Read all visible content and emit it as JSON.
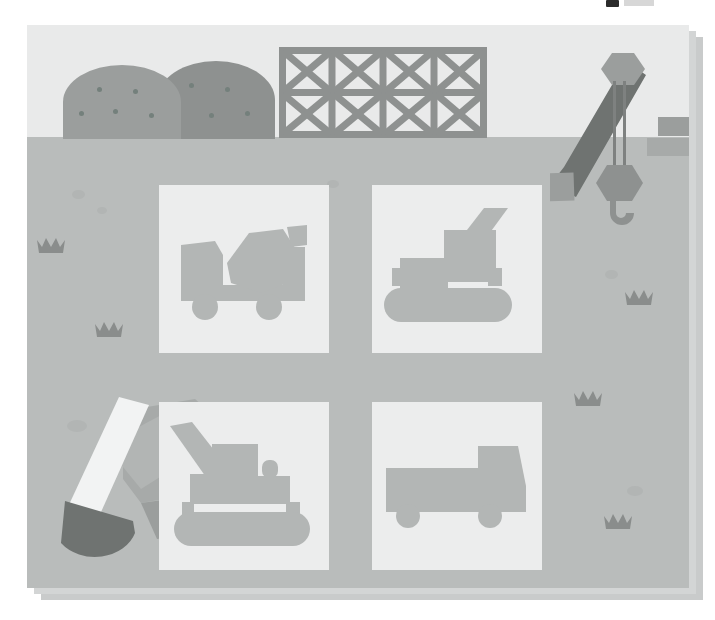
{
  "scene": {
    "title": "Construction Site Illustration",
    "palette": {
      "sky": "#e9eaea",
      "ground": "#b9bcbb",
      "paper_shadow_near": "#d3d5d5",
      "paper_shadow_far": "#c9cbcb",
      "card_background": "#eceded",
      "vehicle_gray": "#b3b6b5",
      "mid_gray": "#9b9e9d",
      "dark_gray": "#8e9190",
      "darkest_gray": "#6f7371",
      "highlight_white": "#f2f3f3",
      "speckle": "#b2b5b4",
      "crown": "#8a8d8c"
    },
    "canvas": {
      "x": 27,
      "y": 25,
      "width": 662,
      "height": 563
    },
    "horizon_y": 112
  },
  "top_strip": {
    "glyph_label": "cropped-text-fragment",
    "chip_label": "cropped-ui-chip"
  },
  "background": {
    "piles": [
      {
        "name": "gravel-pile-back",
        "x": 130,
        "y": 36,
        "w": 118,
        "h": 78,
        "color": "#8e9190",
        "dots": [
          [
            32,
            22
          ],
          [
            68,
            26
          ],
          [
            18,
            47
          ],
          [
            52,
            52
          ],
          [
            88,
            50
          ]
        ]
      },
      {
        "name": "gravel-pile-front",
        "x": 36,
        "y": 40,
        "w": 118,
        "h": 74,
        "color": "#9b9e9d",
        "dots": [
          [
            34,
            22
          ],
          [
            70,
            24
          ],
          [
            16,
            46
          ],
          [
            50,
            44
          ],
          [
            86,
            48
          ]
        ]
      }
    ],
    "scaffold": {
      "name": "scaffold-truss",
      "columns": 4,
      "rows": 2,
      "color": "#8e9190",
      "x": 252,
      "y": 22,
      "w": 208,
      "h": 91
    },
    "crane": {
      "name": "tower-crane",
      "boom_color": "#6f7371",
      "pulley_color": "#9b9e9d",
      "hook_color": "#8e9190",
      "cable_color": "#7e8180"
    },
    "bricks": [
      {
        "name": "brick-top",
        "x": 631,
        "y": 92,
        "w": 64,
        "h": 19,
        "color": "#9b9e9d"
      },
      {
        "name": "brick-bottom",
        "x": 620,
        "y": 113,
        "w": 75,
        "h": 18,
        "color": "#a7aaa9"
      }
    ],
    "excavator_left": {
      "name": "excavator-with-bucket",
      "arm_color": "#f2f3f3",
      "bucket_color": "#6f7371",
      "body_color": "#a7aaa9"
    },
    "speckles": [
      {
        "x": 45,
        "y": 165,
        "w": 13,
        "h": 9
      },
      {
        "x": 70,
        "y": 182,
        "w": 10,
        "h": 7
      },
      {
        "x": 300,
        "y": 155,
        "w": 12,
        "h": 8
      },
      {
        "x": 40,
        "y": 395,
        "w": 20,
        "h": 12
      },
      {
        "x": 605,
        "y": 245,
        "w": 13,
        "h": 9
      },
      {
        "x": 627,
        "y": 461,
        "w": 16,
        "h": 10
      }
    ],
    "crowns": [
      {
        "x": 37,
        "y": 236,
        "w": 28,
        "h": 18
      },
      {
        "x": 95,
        "y": 320,
        "w": 28,
        "h": 18
      },
      {
        "x": 625,
        "y": 288,
        "w": 28,
        "h": 18
      },
      {
        "x": 574,
        "y": 389,
        "w": 28,
        "h": 18
      },
      {
        "x": 604,
        "y": 512,
        "w": 28,
        "h": 18
      }
    ]
  },
  "cards": [
    {
      "id": "card-cement-mixer",
      "icon": "cement-mixer-truck-icon",
      "label": "Cement Mixer Truck"
    },
    {
      "id": "card-crawler-crane",
      "icon": "crawler-crane-icon",
      "label": "Crawler Crane"
    },
    {
      "id": "card-excavator",
      "icon": "excavator-icon",
      "label": "Excavator"
    },
    {
      "id": "card-dump-truck",
      "icon": "dump-truck-icon",
      "label": "Dump Truck"
    }
  ]
}
